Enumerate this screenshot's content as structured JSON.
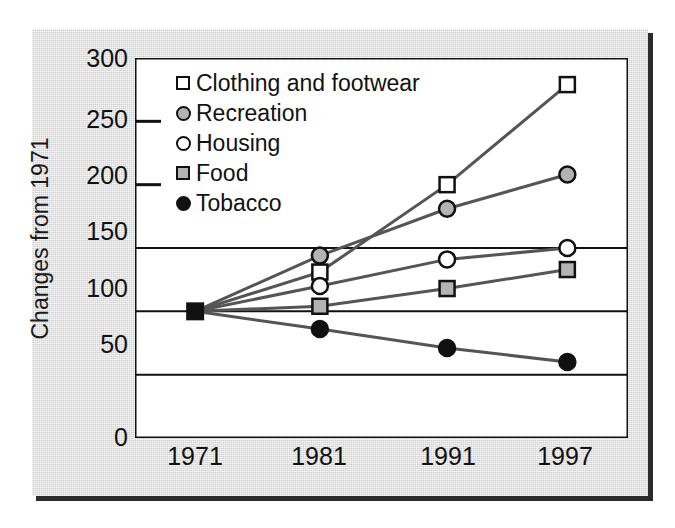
{
  "chart_data": {
    "type": "line",
    "title": "",
    "xlabel": "",
    "ylabel": "Changes from 1971",
    "categories": [
      "1971",
      "1981",
      "1991",
      "1997"
    ],
    "x": [
      1971,
      1981,
      1991,
      1997
    ],
    "xtick_labels": [
      "1971",
      "1981",
      "1991",
      "1997"
    ],
    "ytick_labels": [
      "300",
      "250",
      "200",
      "150",
      "100",
      "50",
      "0"
    ],
    "yticks": [
      300,
      250,
      200,
      150,
      100,
      50,
      0
    ],
    "ylim": [
      0,
      300
    ],
    "grid": "horizontal",
    "legend_position": "upper-left-inside",
    "series": [
      {
        "name": "Clothing and footwear",
        "marker": "open-square",
        "values": [
          100,
          131,
          200,
          279
        ]
      },
      {
        "name": "Recreation",
        "marker": "gray-circle",
        "values": [
          100,
          144,
          181,
          208
        ]
      },
      {
        "name": "Housing",
        "marker": "open-circle",
        "values": [
          100,
          120,
          141,
          150
        ]
      },
      {
        "name": "Food",
        "marker": "gray-square",
        "values": [
          100,
          104,
          118,
          133
        ]
      },
      {
        "name": "Tobacco",
        "marker": "black-circle",
        "values": [
          100,
          86,
          71,
          60
        ]
      }
    ]
  },
  "colors": {
    "panel_background": "#dcdcdc",
    "plot_background": "#ffffff",
    "axis": "#111111",
    "line": "#555555",
    "marker_gray": "#b3b3b3",
    "marker_black": "#111111",
    "shadow": "#2b2b2b"
  },
  "legend": {
    "items": [
      {
        "label": "Clothing and footwear",
        "marker": "open-square-icon"
      },
      {
        "label": "Recreation",
        "marker": "gray-circle-icon"
      },
      {
        "label": "Housing",
        "marker": "open-circle-icon"
      },
      {
        "label": "Food",
        "marker": "gray-square-icon"
      },
      {
        "label": "Tobacco",
        "marker": "black-circle-icon"
      }
    ]
  },
  "axes": {
    "y_title": "Changes from 1971",
    "y_ticks": [
      "300",
      "250",
      "200",
      "150",
      "100",
      "50",
      "0"
    ],
    "x_ticks": [
      "1971",
      "1981",
      "1991",
      "1997"
    ]
  }
}
